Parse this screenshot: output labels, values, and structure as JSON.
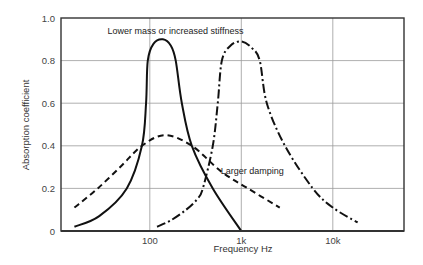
{
  "chart_data": {
    "type": "line",
    "title": "",
    "xlabel": "Frequency Hz",
    "ylabel": "Absorption coefficient",
    "xscale": "log",
    "xlim": [
      10.7,
      60000
    ],
    "ylim": [
      0,
      1.0
    ],
    "grid": true,
    "legend": "none",
    "x_ticks": [
      {
        "value": 100,
        "label": "100"
      },
      {
        "value": 1000,
        "label": "1k"
      },
      {
        "value": 10000,
        "label": "10k"
      }
    ],
    "y_ticks": [
      {
        "value": 0,
        "label": "0"
      },
      {
        "value": 0.2,
        "label": "0.2"
      },
      {
        "value": 0.4,
        "label": "0.4"
      },
      {
        "value": 0.6,
        "label": "0.6"
      },
      {
        "value": 0.8,
        "label": "0.8"
      },
      {
        "value": 1.0,
        "label": "1.0"
      }
    ],
    "series": [
      {
        "name": "Baseline resonance",
        "style": "solid",
        "x": [
          15,
          28,
          56,
          82,
          91,
          95,
          110,
          139,
          170,
          192,
          224,
          288,
          488,
          1000
        ],
        "y": [
          0.02,
          0.07,
          0.2,
          0.4,
          0.6,
          0.8,
          0.88,
          0.9,
          0.87,
          0.8,
          0.6,
          0.4,
          0.2,
          0.0
        ]
      },
      {
        "name": "Larger damping",
        "style": "dashed",
        "x": [
          15,
          27,
          50,
          82,
          146,
          288,
          600,
          1180,
          2630
        ],
        "y": [
          0.11,
          0.2,
          0.31,
          0.4,
          0.45,
          0.4,
          0.28,
          0.2,
          0.11
        ]
      },
      {
        "name": "Lower mass or increased stiffness",
        "style": "dash-dot",
        "x": [
          120,
          170,
          250,
          330,
          380,
          488,
          553,
          613,
          760,
          1000,
          1300,
          1590,
          1900,
          3000,
          6050,
          10000,
          18700
        ],
        "y": [
          0.02,
          0.05,
          0.1,
          0.15,
          0.2,
          0.4,
          0.6,
          0.8,
          0.87,
          0.89,
          0.86,
          0.8,
          0.6,
          0.4,
          0.2,
          0.11,
          0.04
        ]
      }
    ],
    "annotations": [
      {
        "text": "Lower mass or increased stiffness",
        "x": 300,
        "y": 0.92,
        "refers_to": "dash-dot"
      },
      {
        "text": "Larger damping",
        "x": 1400,
        "y": 0.28,
        "refers_to": "dashed"
      }
    ]
  }
}
